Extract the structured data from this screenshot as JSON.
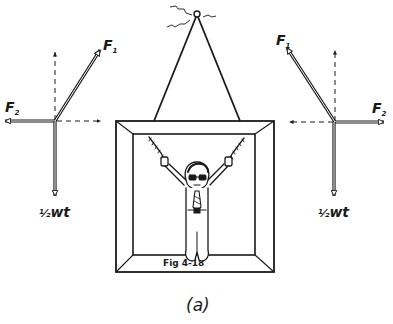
{
  "figure": {
    "caption": "(a)",
    "panel_label": "Fig 4-18",
    "colors": {
      "ink": "#1a1a1a",
      "background": "#ffffff"
    }
  },
  "left_force_diagram": {
    "tension_label": "F",
    "tension_subscript": "1",
    "horizontal_label": "F",
    "horizontal_subscript": "2",
    "weight_label_fraction": "½",
    "weight_label": "wt"
  },
  "right_force_diagram": {
    "tension_label": "F",
    "tension_subscript": "1",
    "horizontal_label": "F",
    "horizontal_subscript": "2",
    "weight_label_fraction": "½",
    "weight_label": "wt"
  },
  "picture": {
    "subject": "man hanging by chains from both arms",
    "hanging_wire": "triangle from nail hook",
    "hook": "nail-hook"
  }
}
